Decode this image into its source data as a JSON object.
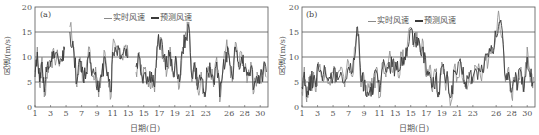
{
  "chart_data": [
    {
      "type": "line",
      "panel_label": "(a)",
      "title": "",
      "xlabel": "日期(日)",
      "ylabel": "风速/(m/s)",
      "ylim": [
        0,
        20
      ],
      "xlim": [
        1,
        31
      ],
      "yticks": [
        0,
        5,
        10,
        15,
        20
      ],
      "xticks": [
        1,
        3,
        5,
        7,
        9,
        11,
        13,
        15,
        17,
        19,
        21,
        23,
        26,
        28,
        30
      ],
      "grid": "horizontal at 5,10,15",
      "legend": {
        "position": "top-center",
        "entries": [
          "实时风速",
          "预测风速"
        ]
      },
      "series": [
        {
          "name": "实时风速",
          "color": "#8a8a8a",
          "x": [
            1,
            1.3,
            1.6,
            1.9,
            2.2,
            2.5,
            2.8,
            3.1,
            3.5,
            4,
            4.5,
            4.8,
            5,
            5.5,
            6,
            6.4,
            6.8,
            7.2,
            7.6,
            8,
            8.4,
            8.8,
            9.2,
            9.6,
            10,
            10.4,
            10.8,
            11,
            11.4,
            11.8,
            12.2,
            12.6,
            13,
            13.4,
            14,
            14.4,
            14.8,
            15.2,
            15.6,
            16,
            16.4,
            16.8,
            17.2,
            17.6,
            18,
            18.4,
            18.8,
            19.2,
            19.6,
            20,
            20.4,
            20.8,
            21.2,
            21.6,
            22,
            22.4,
            22.8,
            23.2,
            23.6,
            24,
            24.4,
            24.8,
            25.2,
            25.6,
            26,
            26.4,
            26.8,
            27.2,
            27.6,
            28,
            28.4,
            28.8,
            29.2,
            29.6,
            30,
            30.4,
            30.8
          ],
          "values": [
            7,
            12,
            4,
            10,
            2,
            6,
            9,
            9.5,
            10,
            9.5,
            9,
            12,
            null,
            16,
            12,
            4,
            10,
            5,
            8,
            12,
            6,
            8,
            2,
            7,
            11,
            6,
            2,
            12,
            11,
            12,
            10,
            12,
            10,
            null,
            7,
            11,
            5,
            8,
            4,
            6,
            3,
            13,
            14,
            9,
            7,
            12,
            6,
            10,
            4,
            12,
            15,
            17,
            5,
            9,
            3,
            7,
            2,
            6,
            8,
            4,
            10,
            1,
            7,
            12,
            10,
            5,
            13,
            8,
            11,
            7,
            6,
            9,
            3,
            7,
            5,
            8,
            6
          ],
          "note": "Approximate hourly wind speed trace; gap near day 5 and day 13.5"
        },
        {
          "name": "预测风速",
          "color": "#3a3a3a",
          "x": [
            1,
            1.3,
            1.6,
            1.9,
            2.2,
            2.5,
            2.8,
            3.1,
            3.5,
            4,
            4.5,
            4.8,
            5,
            5.5,
            6,
            6.4,
            6.8,
            7.2,
            7.6,
            8,
            8.4,
            8.8,
            9.2,
            9.6,
            10,
            10.4,
            10.8,
            11,
            11.4,
            11.8,
            12.2,
            12.6,
            13,
            13.4,
            14,
            14.4,
            14.8,
            15.2,
            15.6,
            16,
            16.4,
            16.8,
            17.2,
            17.6,
            18,
            18.4,
            18.8,
            19.2,
            19.6,
            20,
            20.4,
            20.8,
            21.2,
            21.6,
            22,
            22.4,
            22.8,
            23.2,
            23.6,
            24,
            24.4,
            24.8,
            25.2,
            25.6,
            26,
            26.4,
            26.8,
            27.2,
            27.6,
            28,
            28.4,
            28.8,
            29.2,
            29.6,
            30,
            30.4,
            30.8
          ],
          "values": [
            6,
            11,
            5,
            9,
            3,
            7,
            8,
            9,
            9.8,
            9.6,
            9.2,
            11.5,
            null,
            15,
            11,
            5,
            9,
            6,
            7,
            11,
            7,
            7,
            3,
            6,
            10,
            7,
            3,
            11,
            11.5,
            11.5,
            10.5,
            11.5,
            10,
            null,
            8,
            10,
            6,
            7,
            5,
            7,
            4,
            12.5,
            13.5,
            10,
            8,
            11,
            7,
            9,
            5,
            11,
            14,
            16,
            6,
            8,
            4,
            6,
            3,
            7,
            7,
            5,
            9,
            2,
            8,
            11,
            10,
            6,
            12,
            9,
            10,
            8,
            7,
            8,
            4,
            6,
            6,
            7,
            7
          ]
        }
      ]
    },
    {
      "type": "line",
      "panel_label": "(b)",
      "title": "",
      "xlabel": "日期(日)",
      "ylabel": "风速/(m/s)",
      "ylim": [
        0,
        20
      ],
      "xlim": [
        1,
        31
      ],
      "yticks": [
        0,
        5,
        10,
        15,
        20
      ],
      "xticks": [
        1,
        3,
        5,
        7,
        9,
        11,
        13,
        15,
        17,
        19,
        21,
        23,
        26,
        28,
        30
      ],
      "grid": "horizontal at 5,10,15",
      "legend": {
        "position": "top-center",
        "entries": [
          "实时风速",
          "预测风速"
        ]
      },
      "series": [
        {
          "name": "实时风速",
          "color": "#8a8a8a",
          "x": [
            1,
            1.3,
            1.6,
            1.9,
            2.2,
            2.5,
            2.8,
            3.1,
            3.5,
            4,
            4.5,
            5,
            5.5,
            6,
            6.5,
            7,
            7.5,
            8,
            8.3,
            8.6,
            9,
            9.4,
            9.8,
            10.2,
            10.6,
            11,
            11.4,
            11.8,
            12.2,
            12.6,
            13,
            13.4,
            13.8,
            14.2,
            14.6,
            15,
            15.4,
            15.8,
            16.2,
            16.6,
            17,
            17.4,
            17.8,
            18.2,
            18.6,
            19,
            19.4,
            19.8,
            20.2,
            20.6,
            21,
            21.5,
            22,
            22.5,
            23,
            23.5,
            24,
            24.5,
            25,
            25.5,
            26,
            26.4,
            26.8,
            27.2,
            27.6,
            28,
            28.4,
            28.8,
            29.2,
            29.6,
            30,
            30.4,
            30.8
          ],
          "values": [
            3,
            8,
            1,
            6,
            4,
            7,
            3,
            9,
            6,
            8,
            5,
            7,
            6,
            8,
            4,
            9,
            6,
            14.5,
            14,
            4,
            6,
            2,
            5,
            3,
            8,
            2,
            9,
            6,
            10,
            7,
            9,
            6,
            11,
            9,
            13,
            16,
            12,
            15,
            11,
            13,
            6,
            8,
            3,
            7,
            2,
            9,
            5,
            6,
            1,
            8,
            6,
            9,
            4,
            7,
            5,
            8,
            6,
            10,
            9,
            12,
            15,
            18,
            14,
            5,
            8,
            2,
            6,
            4,
            8,
            3,
            12,
            5,
            6
          ]
        },
        {
          "name": "预测风速",
          "color": "#3a3a3a",
          "x": [
            1,
            1.3,
            1.6,
            1.9,
            2.2,
            2.5,
            2.8,
            3.1,
            3.5,
            4,
            4.5,
            5,
            5.5,
            6,
            6.5,
            7,
            7.5,
            8,
            8.3,
            8.6,
            9,
            9.4,
            9.8,
            10.2,
            10.6,
            11,
            11.4,
            11.8,
            12.2,
            12.6,
            13,
            13.4,
            13.8,
            14.2,
            14.6,
            15,
            15.4,
            15.8,
            16.2,
            16.6,
            17,
            17.4,
            17.8,
            18.2,
            18.6,
            19,
            19.4,
            19.8,
            20.2,
            20.6,
            21,
            21.5,
            22,
            22.5,
            23,
            23.5,
            24,
            24.5,
            25,
            25.5,
            26,
            26.4,
            26.8,
            27.2,
            27.6,
            28,
            28.4,
            28.8,
            29.2,
            29.6,
            30,
            30.4,
            30.8
          ],
          "values": [
            4,
            7,
            2,
            5,
            5,
            6,
            4,
            8,
            7,
            7,
            6,
            6,
            7,
            7,
            5,
            8,
            7,
            14,
            14.5,
            5,
            5,
            3,
            4,
            4,
            7,
            3,
            8,
            7,
            9,
            8,
            8,
            7,
            10,
            10,
            12,
            15.5,
            13,
            14,
            12,
            12,
            7,
            7,
            4,
            6,
            3,
            8,
            6,
            5,
            2,
            7,
            7,
            8,
            5,
            6,
            6,
            7,
            7,
            9,
            10,
            11,
            14,
            17,
            15,
            6,
            7,
            3,
            5,
            5,
            7,
            4,
            10,
            6,
            5
          ]
        }
      ]
    }
  ],
  "panels": [
    {
      "tag": "(a)",
      "ylabel": "风速/(m/s)",
      "xlabel": "日期(日)",
      "legend_real": "实时风速",
      "legend_pred": "预测风速"
    },
    {
      "tag": "(b)",
      "ylabel": "风速/(m/s)",
      "xlabel": "日期(日)",
      "legend_real": "实时风速",
      "legend_pred": "预测风速"
    }
  ],
  "colors": {
    "real": "#8a8a8a",
    "pred": "#3a3a3a",
    "axis": "#555555",
    "grid": "#555555"
  }
}
